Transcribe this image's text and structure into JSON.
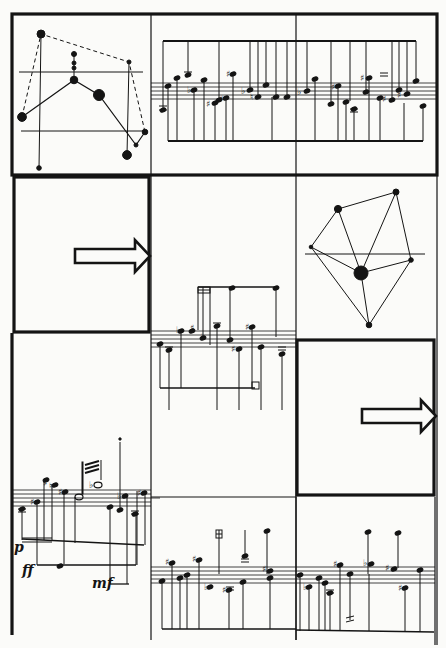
{
  "page": {
    "background": "#fbfbf9",
    "ink": "#141414"
  },
  "grid": {
    "columns_x": [
      12,
      151,
      296,
      437
    ],
    "rows_y": [
      14,
      175,
      333,
      497,
      630
    ],
    "cells": [
      {
        "id": "r1c1",
        "content": "graph-dashed-solid",
        "heavy_border": true
      },
      {
        "id": "r1c2-3",
        "content": "staff-cluster-long",
        "heavy_border": true
      },
      {
        "id": "r2c1",
        "content": "arrow-box",
        "heavy_border": true
      },
      {
        "id": "r2c2",
        "content": "staff-cluster-small",
        "heavy_border": false
      },
      {
        "id": "r2c3",
        "content": "polygon-graph",
        "heavy_border": false
      },
      {
        "id": "r3c1",
        "content": "staff-with-dynamics",
        "heavy_border": false
      },
      {
        "id": "r3c3",
        "content": "arrow-box",
        "heavy_border": true
      },
      {
        "id": "r4c2-3",
        "content": "staff-cluster-bottom",
        "heavy_border": false
      }
    ]
  },
  "dynamics": {
    "p": "p",
    "ff": "ff",
    "mf": "mf"
  },
  "accidentals": {
    "sharp": "♯",
    "flat": "♭",
    "natural": "♮"
  }
}
